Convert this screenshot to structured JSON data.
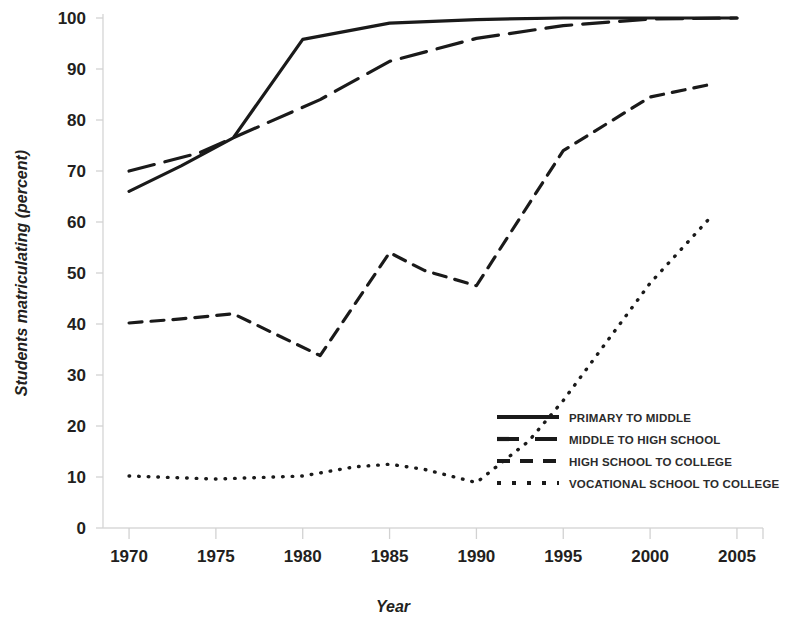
{
  "chart_data": {
    "type": "line",
    "title": "",
    "xlabel": "Year",
    "ylabel": "Students matriculating (percent)",
    "xlim": [
      1968.5,
      2006.5
    ],
    "ylim": [
      0,
      100
    ],
    "xticks": [
      1970,
      1975,
      1980,
      1985,
      1990,
      1995,
      2000,
      2005
    ],
    "yticks": [
      0,
      10,
      20,
      30,
      40,
      50,
      60,
      70,
      80,
      90,
      100
    ],
    "grid": false,
    "legend_position": "lower right",
    "series": [
      {
        "name": "PRIMARY TO MIDDLE",
        "style": "solid",
        "x": [
          1970,
          1973,
          1976,
          1980,
          1985,
          1990,
          1995,
          2000,
          2005
        ],
        "values": [
          66,
          71,
          76.5,
          95.8,
          99,
          99.7,
          100,
          100,
          100
        ]
      },
      {
        "name": "MIDDLE TO HIGH SCHOOL",
        "style": "long-dash",
        "x": [
          1970,
          1974,
          1978,
          1981,
          1985,
          1990,
          1995,
          2000,
          2005
        ],
        "values": [
          70,
          73.5,
          79.5,
          84,
          91.5,
          96,
          98.5,
          99.8,
          100
        ]
      },
      {
        "name": "HIGH SCHOOL TO COLLEGE",
        "style": "dash",
        "x": [
          1970,
          1973,
          1976,
          1981,
          1985,
          1987,
          1990,
          1995,
          2000,
          2003.5
        ],
        "values": [
          40.2,
          41,
          42,
          33.8,
          54,
          50.5,
          47.5,
          74,
          84.5,
          87
        ]
      },
      {
        "name": "VOCATIONAL SCHOOL TO COLLEGE",
        "style": "dotted",
        "x": [
          1970,
          1975,
          1980,
          1983,
          1985,
          1987,
          1990,
          1993,
          1995,
          2000,
          2003.5
        ],
        "values": [
          10.2,
          9.6,
          10.2,
          12,
          12.5,
          11.5,
          8.9,
          17,
          25,
          48,
          61
        ]
      }
    ]
  },
  "legend": {
    "items": [
      {
        "label": "PRIMARY TO MIDDLE",
        "style": "solid"
      },
      {
        "label": "MIDDLE TO HIGH SCHOOL",
        "style": "long-dash"
      },
      {
        "label": "HIGH SCHOOL TO COLLEGE",
        "style": "dash"
      },
      {
        "label": "VOCATIONAL SCHOOL TO COLLEGE",
        "style": "dotted"
      }
    ]
  },
  "colors": {
    "line": "#1a1a1a",
    "axis": "#d8d8d8",
    "text": "#231f20",
    "background": "#ffffff"
  }
}
